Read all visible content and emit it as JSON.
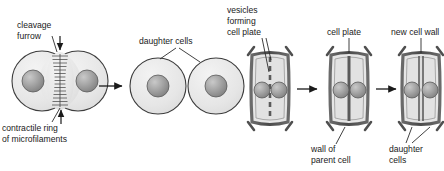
{
  "figure": {
    "background_color": "#ffffff"
  },
  "palette": {
    "cytoplasm_fill": "#e8e8e8",
    "cytoplasm_stroke": "#3c3c3c",
    "nucleus_fill": "#9a9a9a",
    "nucleus_stroke": "#4a4a4a",
    "cell_wall": "#4f4f4f",
    "cell_plate": "#5a5a5a",
    "label_color": "#1a1a1a",
    "leader_color": "#2b2b2b",
    "arrow_color": "#1a1a1a"
  },
  "animal_panel": {
    "name": "animal-cell-cytokinesis",
    "labels": {
      "cleavage_furrow_line1": "cleavage",
      "cleavage_furrow_line2": "furrow",
      "contractile_ring_line1": "contractile ring",
      "contractile_ring_line2": "of microfilaments",
      "daughter_cells": "daughter cells"
    },
    "stages": [
      {
        "name": "dividing-cell",
        "description": "Cell constricted by cleavage furrow with contractile ring",
        "nuclei": 2
      },
      {
        "name": "daughter-cell-left",
        "description": "Separated daughter cell",
        "nuclei": 1
      },
      {
        "name": "daughter-cell-right",
        "description": "Separated daughter cell",
        "nuclei": 1
      }
    ],
    "transition_arrows": 1
  },
  "plant_panel": {
    "name": "plant-cell-cytokinesis",
    "labels": {
      "vesicles_line1": "vesicles",
      "vesicles_line2": "forming",
      "vesicles_line3": "cell plate",
      "cell_plate": "cell plate",
      "new_cell_wall": "new cell wall",
      "wall_parent_line1": "wall of",
      "wall_parent_line2": "parent cell",
      "daughter_line1": "daughter",
      "daughter_line2": "cells"
    },
    "stages": [
      {
        "name": "plant-cell-stage-1",
        "description": "Vesicles aligned as dashed cell plate forming",
        "divider_style": "dashed",
        "nuclei": 2
      },
      {
        "name": "plant-cell-stage-2",
        "description": "Continuous cell plate spanning the cell",
        "divider_style": "solid",
        "nuclei": 2
      },
      {
        "name": "plant-cell-stage-3",
        "description": "New cell wall separating two daughter cells",
        "divider_style": "double",
        "nuclei": 2
      }
    ],
    "transition_arrows": 2
  }
}
